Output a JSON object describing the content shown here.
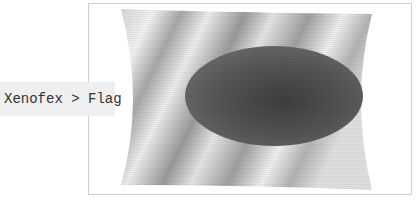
{
  "breadcrumb": {
    "text": "Xenofex > Flag",
    "parts": [
      "Xenofex",
      "Flag"
    ],
    "separator": ">"
  },
  "image": {
    "subject": "waving-flag-with-dark-ellipse",
    "colors": {
      "field_light": "#e8e8e8",
      "field_dark": "#8c8c8c",
      "disc": "#555555",
      "frame_border": "#cfcfcf",
      "label_bg": "#efefef"
    }
  }
}
